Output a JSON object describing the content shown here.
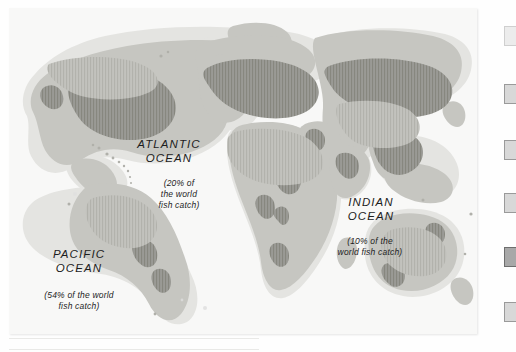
{
  "figure": {
    "kind": "world-map",
    "caption_labels": {
      "pacific": {
        "name": "PACIFIC\nOCEAN",
        "stat": "(54% of the world\nfish catch)"
      },
      "atlantic": {
        "name": "ATLANTIC\nOCEAN",
        "stat": "(20% of\nthe world\nfish catch)"
      },
      "indian": {
        "name": "INDIAN\nOCEAN",
        "stat": "(10% of the\nworld fish catch)"
      }
    },
    "colors": {
      "ocean": "#f8f8f7",
      "shelf": "#e2e2df",
      "land_light": "#d6d6d2",
      "land_mid": "#b9b9b4",
      "land_dark": "#8e8e89",
      "ink": "#1d1d1d"
    }
  },
  "chart_data": {
    "type": "pie",
    "categories": [
      "Pacific Ocean",
      "Atlantic Ocean",
      "Indian Ocean"
    ],
    "values": [
      54,
      20,
      10
    ],
    "unit": "% of the world fish catch",
    "xlabel": "",
    "ylabel": "",
    "ylim": [
      0,
      100
    ],
    "grid": false,
    "legend": "none",
    "annotations": [
      "PACIFIC OCEAN (54% of the world fish catch)",
      "ATLANTIC OCEAN (20% of the world fish catch)",
      "INDIAN OCEAN (10% of the world fish catch)"
    ]
  },
  "edge_boxes": [
    {
      "name": "edge-box-1",
      "top": 26,
      "style": "faint"
    },
    {
      "name": "edge-box-2",
      "top": 84,
      "style": "normal"
    },
    {
      "name": "edge-box-3",
      "top": 140,
      "style": "normal"
    },
    {
      "name": "edge-box-4",
      "top": 193,
      "style": "normal"
    },
    {
      "name": "edge-box-5",
      "top": 247,
      "style": "dark"
    },
    {
      "name": "edge-box-6",
      "top": 302,
      "style": "normal"
    }
  ]
}
